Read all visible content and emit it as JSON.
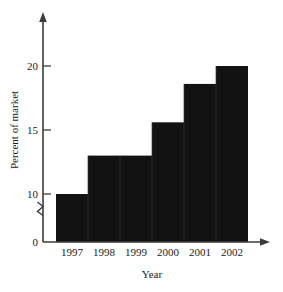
{
  "chart_data": {
    "type": "bar",
    "title": "",
    "subtitle": "",
    "xlabel": "Year",
    "ylabel": "Percent of market",
    "categories": [
      "1997",
      "1998",
      "1999",
      "2000",
      "2001",
      "2002"
    ],
    "values": [
      10,
      13,
      13,
      15.6,
      18.6,
      20
    ],
    "ytick_labels": [
      "0",
      "10",
      "15",
      "20"
    ],
    "ytick_values": [
      0,
      10,
      15,
      20
    ],
    "ylim": [
      0,
      23
    ],
    "axis_break": true,
    "axis_break_between": [
      0,
      10
    ],
    "grid": false,
    "legend": false,
    "legend_position": "none",
    "bar_color": "#121212",
    "axis_color": "#3b3b3b",
    "background_color": "#ffffff",
    "annotations": []
  },
  "axes": {
    "y_axis_label": "Percent of market",
    "x_axis_label": "Year",
    "y_ticks": [
      {
        "label": "20",
        "value": 20
      },
      {
        "label": "15",
        "value": 15
      },
      {
        "label": "10",
        "value": 10
      },
      {
        "label": "0",
        "value": 0
      }
    ],
    "x_ticks": [
      {
        "label": "1997"
      },
      {
        "label": "1998"
      },
      {
        "label": "1999"
      },
      {
        "label": "2000"
      },
      {
        "label": "2001"
      },
      {
        "label": "2002"
      }
    ]
  },
  "bars": [
    {
      "category": "1997",
      "value": 10
    },
    {
      "category": "1998",
      "value": 13
    },
    {
      "category": "1999",
      "value": 13
    },
    {
      "category": "2000",
      "value": 15.6
    },
    {
      "category": "2001",
      "value": 18.6
    },
    {
      "category": "2002",
      "value": 20
    }
  ]
}
